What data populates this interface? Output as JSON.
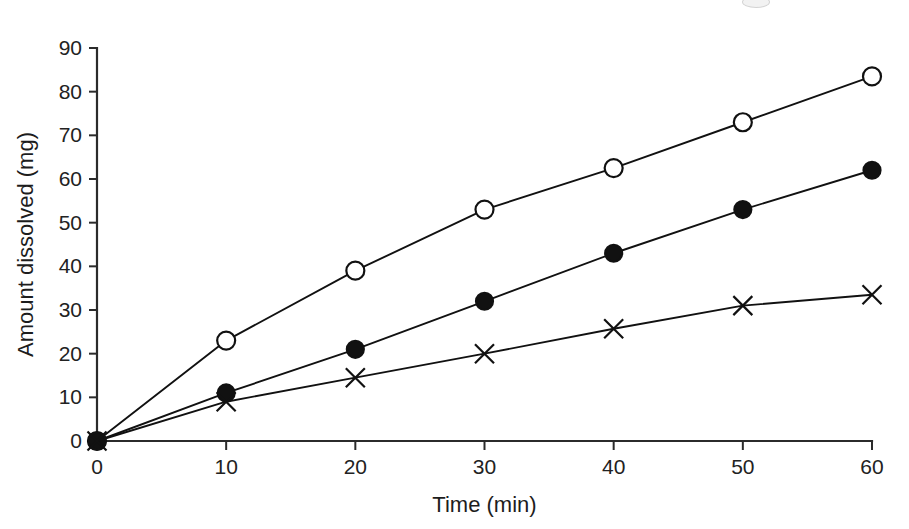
{
  "chart_data": {
    "type": "line",
    "title": "",
    "subtitle": "",
    "xlabel": "Time (min)",
    "ylabel": "Amount dissolved (mg)",
    "x": [
      0,
      10,
      20,
      30,
      40,
      50,
      60
    ],
    "xlim": [
      0,
      60
    ],
    "ylim": [
      0,
      90
    ],
    "xticks": [
      0,
      10,
      20,
      30,
      40,
      50,
      60
    ],
    "yticks": [
      0,
      10,
      20,
      30,
      40,
      50,
      60,
      70,
      80,
      90
    ],
    "xtick_labels": [
      "0",
      "10",
      "20",
      "30",
      "40",
      "50",
      "60"
    ],
    "ytick_labels": [
      "0",
      "10",
      "20",
      "30",
      "40",
      "50",
      "60",
      "70",
      "80",
      "90"
    ],
    "grid": false,
    "legend": "none",
    "series": [
      {
        "name": "open-circle-series",
        "marker": "open-circle",
        "color": "#111111",
        "values": [
          0,
          23,
          39,
          53,
          62.5,
          73,
          83.5
        ]
      },
      {
        "name": "filled-circle-series",
        "marker": "filled-circle",
        "color": "#111111",
        "values": [
          0,
          11,
          21,
          32,
          43,
          53,
          62
        ]
      },
      {
        "name": "cross-series",
        "marker": "cross",
        "color": "#111111",
        "values": [
          0,
          9,
          14.5,
          20,
          25.7,
          31,
          33.5
        ]
      }
    ]
  },
  "plot": {
    "background_color": "#ffffff",
    "axis_color": "#2b2b2b",
    "line_color": "#111111"
  }
}
